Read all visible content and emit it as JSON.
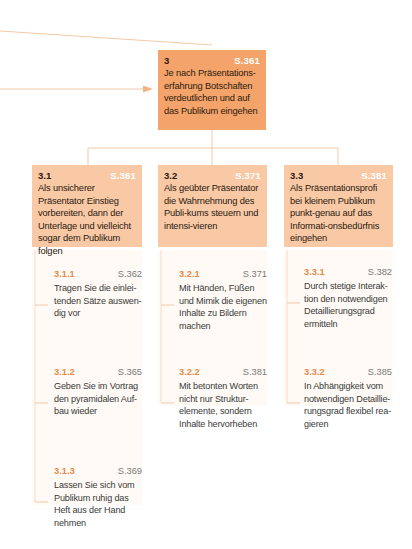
{
  "colors": {
    "level1_fill": "#f4a46a",
    "level2_fill": "#f9c9a6",
    "column_fill": "#fffaf5",
    "connector": "#f2c9a6",
    "item_number": "#e78a4a",
    "page_ref_on_box": "#ffffff",
    "page_ref_item": "#7a7a7a"
  },
  "root": {
    "number": "3",
    "page": "S.361",
    "text": "Je nach Präsentations-erfahrung Botschaften verdeutlichen und auf das Publikum eingehen"
  },
  "branches": [
    {
      "number": "3.1",
      "page": "S.361",
      "text": "Als unsicherer Präsentator Einstieg vorbereiten, dann der Unterlage und vielleicht sogar dem Publikum folgen",
      "items": [
        {
          "number": "3.1.1",
          "page": "S.362",
          "text": "Tragen Sie die einlei-tenden Sätze auswen-dig vor"
        },
        {
          "number": "3.1.2",
          "page": "S.365",
          "text": "Geben Sie im Vortrag den pyramidalen Auf-bau wieder"
        },
        {
          "number": "3.1.3",
          "page": "S.369",
          "text": "Lassen Sie sich vom Publikum ruhig das Heft aus der Hand nehmen"
        }
      ]
    },
    {
      "number": "3.2",
      "page": "S.371",
      "text": "Als geübter Präsentator die Wahrnehmung des Publi-kums steuern und intensi-vieren",
      "items": [
        {
          "number": "3.2.1",
          "page": "S.371",
          "text": "Mit Händen, Füßen und Mimik die eigenen Inhalte zu Bildern machen"
        },
        {
          "number": "3.2.2",
          "page": "S.381",
          "text": "Mit betonten Worten nicht nur Struktur-elemente, sondern Inhalte hervorheben"
        }
      ]
    },
    {
      "number": "3.3",
      "page": "S.381",
      "text": "Als Präsentationsprofi bei kleinem Publikum punkt-genau auf das Informati-onsbedürfnis eingehen",
      "items": [
        {
          "number": "3.3.1",
          "page": "S.382",
          "text": "Durch stetige Interak-tion den notwendigen Detaillierungsgrad ermitteln"
        },
        {
          "number": "3.3.2",
          "page": "S.385",
          "text": "In Abhängigkeit vom notwendigen Detaillie-rungsgrad flexibel rea-gieren"
        }
      ]
    }
  ]
}
